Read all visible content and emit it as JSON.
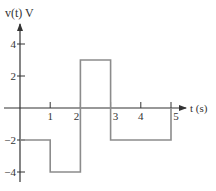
{
  "chart_data": {
    "type": "line",
    "title": "v(t) V",
    "xlabel": "t (s)",
    "ylabel": "v(t) V",
    "x_ticks": [
      "1",
      "2",
      "3",
      "4",
      "5"
    ],
    "y_ticks": [
      "4",
      "2",
      "-2",
      "-4"
    ],
    "xlim": [
      0,
      5.5
    ],
    "ylim": [
      -4.5,
      5
    ],
    "grid": false,
    "legend": null,
    "series": [
      {
        "name": "v(t)",
        "step": true,
        "segments": [
          {
            "t_start": 0,
            "t_end": 1,
            "value": -2
          },
          {
            "t_start": 1,
            "t_end": 2,
            "value": -4
          },
          {
            "t_start": 2,
            "t_end": 3,
            "value": 3
          },
          {
            "t_start": 3,
            "t_end": 5,
            "value": -2
          }
        ],
        "x": [
          0,
          1,
          1,
          2,
          2,
          3,
          3,
          5,
          5
        ],
        "y": [
          -2,
          -2,
          -4,
          -4,
          3,
          3,
          -2,
          -2,
          0
        ]
      }
    ]
  },
  "colors": {
    "axis": "#333333",
    "waveform": "#8c8c8c"
  }
}
